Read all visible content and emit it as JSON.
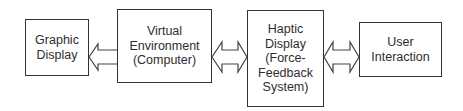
{
  "diagram": {
    "nodes": [
      {
        "id": "graphic-display",
        "label": "Graphic\nDisplay"
      },
      {
        "id": "virtual-environment",
        "label": "Virtual\nEnvironment\n(Computer)"
      },
      {
        "id": "haptic-display",
        "label": "Haptic\nDisplay\n(Force-\nFeedback\nSystem)"
      },
      {
        "id": "user-interaction",
        "label": "User\nInteraction"
      }
    ],
    "edges": [
      {
        "from": "virtual-environment",
        "to": "graphic-display",
        "type": "single-arrow"
      },
      {
        "from": "virtual-environment",
        "to": "haptic-display",
        "type": "double-arrow"
      },
      {
        "from": "haptic-display",
        "to": "user-interaction",
        "type": "double-arrow"
      }
    ]
  }
}
